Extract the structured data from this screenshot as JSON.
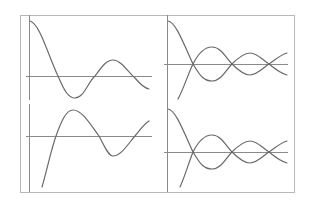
{
  "figure": {
    "background": "#ffffff",
    "frame_color": "#b8b8b8",
    "line_color": "#6a6a6a",
    "axis_color": "#8a8a8a",
    "frame": {
      "x": 20,
      "y": 15,
      "w": 274,
      "h": 177
    }
  },
  "panels": [
    {
      "id": "top-left",
      "description": "damped oscillation starting at maximum (cosine-like, e.g. J0)",
      "vaxis": {
        "x": 29,
        "y1": 15,
        "y2": 100
      },
      "haxis": {
        "y": 76,
        "x1": 26,
        "x2": 152
      },
      "curves": [
        {
          "path": "M30,21 C40,24 48,55 58,76 C64,90 68,98 75,98 C84,98 88,82 95,76 C101,68 106,60 113,60 C121,60 128,72 135,78 C140,84 144,88 149,89"
        }
      ]
    },
    {
      "id": "top-right",
      "description": "pair of mirrored damped oscillations crossing the axis",
      "vaxis": {
        "x": 167,
        "y1": 15,
        "y2": 108
      },
      "haxis": {
        "y": 64,
        "x1": 164,
        "x2": 288
      },
      "curves": [
        {
          "path": "M168,21 C176,22 184,45 193,64 C200,76 204,81 212,81 C221,81 226,70 232,64 C238,58 244,53 250,53 C257,53 263,60 269,64 C275,69 280,73 287,75"
        },
        {
          "path": "M178,99 C184,88 188,74 193,64 C198,54 204,47 212,47 C221,47 226,58 232,64 C238,70 244,75 250,75 C257,75 263,68 269,64 C275,60 280,55 287,53"
        }
      ]
    },
    {
      "id": "bottom-left",
      "description": "damped oscillation starting at minimum (sine-like, e.g. Y0)",
      "vaxis": {
        "x": 29,
        "y1": 104,
        "y2": 192
      },
      "haxis": {
        "y": 136,
        "x1": 26,
        "x2": 152
      },
      "curves": [
        {
          "path": "M42,187 C47,170 51,150 56,136 C61,122 66,110 73,110 C82,110 90,124 99,136 C104,145 108,156 113,156 C121,156 128,144 135,136 C140,130 144,124 149,121"
        }
      ]
    },
    {
      "id": "bottom-right",
      "description": "pair of mirrored damped oscillations crossing the axis",
      "vaxis": {
        "x": 167,
        "y1": 108,
        "y2": 192
      },
      "haxis": {
        "y": 152,
        "x1": 164,
        "x2": 288
      },
      "curves": [
        {
          "path": "M168,109 C176,110 184,133 193,152 C200,164 204,169 212,169 C221,169 226,158 232,152 C238,146 244,141 250,141 C257,141 263,148 269,152 C275,157 280,161 287,163"
        },
        {
          "path": "M180,187 C185,176 189,162 193,152 C198,142 204,135 212,135 C221,135 226,146 232,152 C238,158 244,163 250,163 C257,163 263,156 269,152 C275,148 280,143 287,141"
        }
      ]
    }
  ]
}
